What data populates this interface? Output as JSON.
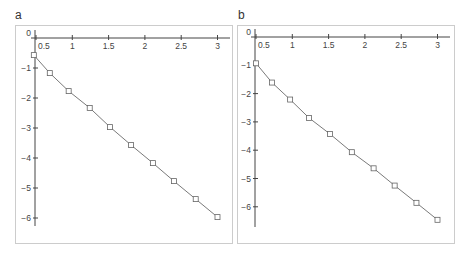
{
  "chart_data": [
    {
      "panel": "a",
      "type": "line",
      "markers": "open-square",
      "title": "",
      "xlabel": "",
      "ylabel": "",
      "xlim": [
        0.45,
        3.1
      ],
      "ylim": [
        -6.3,
        0
      ],
      "x_ticks": [
        0.5,
        1,
        1.5,
        2,
        2.5,
        3
      ],
      "x_tick_labels": [
        "0.5",
        "1",
        "1.5",
        "2",
        "2.5",
        "3"
      ],
      "y_ticks": [
        0,
        -1,
        -2,
        -3,
        -4,
        -5,
        -6
      ],
      "y_tick_labels": [
        "0",
        "−1",
        "−2",
        "−3",
        "−4",
        "−5",
        "−6"
      ],
      "grid": false,
      "x": [
        0.47,
        0.69,
        0.95,
        1.24,
        1.52,
        1.81,
        2.11,
        2.4,
        2.7,
        3.0
      ],
      "y": [
        -0.57,
        -1.17,
        -1.77,
        -2.33,
        -2.97,
        -3.57,
        -4.17,
        -4.77,
        -5.37,
        -5.97
      ]
    },
    {
      "panel": "b",
      "type": "line",
      "markers": "open-square",
      "title": "",
      "xlabel": "",
      "ylabel": "",
      "xlim": [
        0.45,
        3.1
      ],
      "ylim": [
        -6.8,
        0
      ],
      "x_ticks": [
        0.5,
        1,
        1.5,
        2,
        2.5,
        3
      ],
      "x_tick_labels": [
        "0.5",
        "1",
        "1.5",
        "2",
        "2.5",
        "3"
      ],
      "y_ticks": [
        0,
        -1,
        -2,
        -3,
        -4,
        -5,
        -6
      ],
      "y_tick_labels": [
        "0",
        "−1",
        "−2",
        "−3",
        "−4",
        "−5",
        "−6"
      ],
      "grid": false,
      "x": [
        0.5,
        0.72,
        0.97,
        1.23,
        1.52,
        1.82,
        2.12,
        2.41,
        2.71,
        3.0
      ],
      "y": [
        -0.93,
        -1.61,
        -2.21,
        -2.86,
        -3.43,
        -4.07,
        -4.64,
        -5.25,
        -5.86,
        -6.46
      ]
    }
  ],
  "panels": {
    "a": {
      "label": "a"
    },
    "b": {
      "label": "b"
    }
  },
  "colors": {
    "line": "#7a7a7a",
    "axis": "#444444",
    "frame": "#cccccc"
  }
}
